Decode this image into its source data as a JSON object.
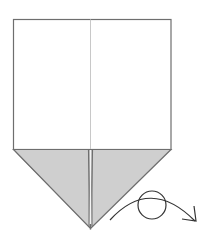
{
  "diagram": {
    "type": "origami-step",
    "colors": {
      "background": "#ffffff",
      "paper_front": "#ffffff",
      "paper_back_shaded": "#cfcfcf",
      "outline": "#6e6e6e",
      "crease": "#c8c8c8",
      "symbol": "#333333"
    },
    "paper": {
      "top_left": [
        13,
        19
      ],
      "top_right": [
        171,
        19
      ],
      "fold_line_y": 149,
      "bottom_tip": [
        90,
        228
      ],
      "center_crease_x": 90
    },
    "symbols": [
      {
        "name": "turn-over",
        "meaning": "Turn the model over",
        "circle_center": [
          152,
          205
        ],
        "circle_radius": 14
      }
    ]
  }
}
